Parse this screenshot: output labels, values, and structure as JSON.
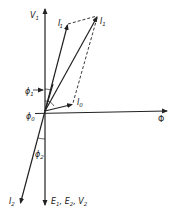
{
  "diagram": {
    "type": "phasor-diagram",
    "origin": {
      "x": 45,
      "y": 111
    },
    "vectors": [
      {
        "id": "V1",
        "label": "V",
        "sub": "1",
        "prime": "",
        "from": [
          45,
          111
        ],
        "to": [
          45,
          8
        ],
        "style": "solid"
      },
      {
        "id": "I1prime",
        "label": "I",
        "sub": "1",
        "prime": "′",
        "from": [
          45,
          111
        ],
        "to": [
          68,
          24
        ],
        "style": "solid"
      },
      {
        "id": "I1",
        "label": "I",
        "sub": "1",
        "prime": "",
        "from": [
          45,
          111
        ],
        "to": [
          98,
          16
        ],
        "style": "solid"
      },
      {
        "id": "I0",
        "label": "I",
        "sub": "0",
        "prime": "",
        "from": [
          45,
          111
        ],
        "to": [
          73,
          104
        ],
        "style": "solid"
      },
      {
        "id": "Phi",
        "label": "Φ",
        "sub": "",
        "prime": "",
        "from": [
          45,
          111
        ],
        "to": [
          168,
          111
        ],
        "style": "solid"
      },
      {
        "id": "E",
        "label": "E",
        "sub": "1",
        "prime": "",
        "from": [
          45,
          111
        ],
        "to": [
          45,
          206
        ],
        "style": "solid"
      },
      {
        "id": "I2",
        "label": "I",
        "sub": "2",
        "prime": "",
        "from": [
          45,
          111
        ],
        "to": [
          20,
          204
        ],
        "style": "solid"
      }
    ],
    "dashed_lines": [
      {
        "from": [
          68,
          24
        ],
        "to": [
          98,
          16
        ]
      },
      {
        "from": [
          98,
          16
        ],
        "to": [
          73,
          104
        ]
      }
    ],
    "angles": [
      {
        "label": "ϕ",
        "sub": "1"
      },
      {
        "label": "ϕ",
        "sub": "0"
      },
      {
        "label": "ϕ",
        "sub": "2"
      }
    ],
    "labels": {
      "v1": {
        "main": "V",
        "sub": "1"
      },
      "i1prime": {
        "main": "I",
        "sub": "1",
        "prime": "′"
      },
      "i1": {
        "main": "I",
        "sub": "1"
      },
      "i0": {
        "main": "I",
        "sub": "0"
      },
      "phi": {
        "main": "Φ"
      },
      "phi1": {
        "main": "ϕ",
        "sub": "1"
      },
      "phi0": {
        "main": "ϕ",
        "sub": "0"
      },
      "phi2": {
        "main": "ϕ",
        "sub": "2"
      },
      "i2": {
        "main": "I",
        "sub": "2"
      },
      "e_group": {
        "e1": "E",
        "e1_sub": "1",
        "sep1": ", ",
        "e2": "E",
        "e2_sub": "2",
        "sep2": ", ",
        "v2": "V",
        "v2_sub": "2"
      }
    }
  }
}
